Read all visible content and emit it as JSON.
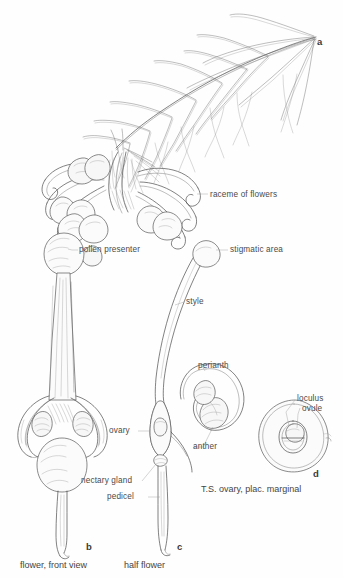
{
  "plate": {
    "title_fragment_top_right": "",
    "background_color": "#fefefe",
    "ink_color": "#4c4c4c",
    "label_color": "#4a4a4a"
  },
  "figures": [
    {
      "letter": "a",
      "subject": "raceme of flowers",
      "caption": "",
      "inline_label": "raceme of flowers"
    },
    {
      "letter": "b",
      "subject": "flower, front view",
      "caption": "flower, front view",
      "inline_label": ""
    },
    {
      "letter": "c",
      "subject": "half flower",
      "caption": "half flower",
      "inline_label": ""
    },
    {
      "letter": "d",
      "subject": "transverse section of ovary",
      "caption": "T.S. ovary, plac. marginal",
      "inline_label": ""
    }
  ],
  "labels": {
    "raceme_of_flowers": "raceme of flowers",
    "pollen_presenter": "pollen presenter",
    "stigmatic_area": "stigmatic area",
    "style": "style",
    "perianth": "perianth",
    "anther": "anther",
    "ovary": "ovary",
    "nectary_gland": "nectary gland",
    "pedicel": "pedicel",
    "loculus": "loculus",
    "ovule": "ovule"
  },
  "captions": {
    "fig_b": "flower, front view",
    "fig_c": "half flower",
    "fig_d": "T.S. ovary, plac. marginal"
  },
  "figure_letters": {
    "a": "a",
    "b": "b",
    "c": "c",
    "d": "d"
  }
}
